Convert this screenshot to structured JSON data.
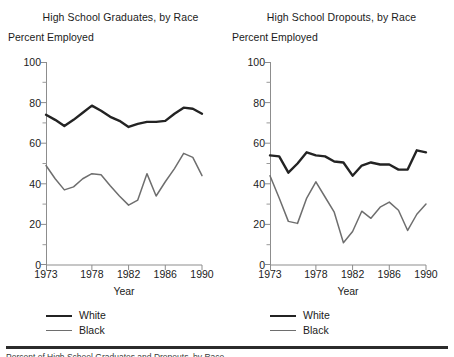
{
  "figure": {
    "axis_color": "#8d8d8d",
    "white_series_color": "#232323",
    "black_series_color": "#6e6e6e",
    "rule_color": "#2b2b2b",
    "footnote": "Percent of High School Graduates and Dropouts, by Race"
  },
  "panels": [
    {
      "title": "High School Graduates, by Race",
      "ylabel": "Percent Employed",
      "xlabel": "Year",
      "legend": [
        {
          "label": "White"
        },
        {
          "label": "Black"
        }
      ]
    },
    {
      "title": "High School Dropouts, by Race",
      "ylabel": "Percent Employed",
      "xlabel": "Year",
      "legend": [
        {
          "label": "White"
        },
        {
          "label": "Black"
        }
      ]
    }
  ],
  "chart_data": [
    {
      "type": "line",
      "title": "High School Graduates, by Race",
      "xlabel": "Year",
      "ylabel": "Percent Employed",
      "xlim": [
        1973,
        1990
      ],
      "ylim": [
        0,
        100
      ],
      "ytick_labels": [
        "0",
        "20",
        "40",
        "60",
        "80",
        "100"
      ],
      "ytick_values": [
        0,
        20,
        40,
        60,
        80,
        100
      ],
      "yminor_values": [
        10,
        30,
        50,
        70,
        90
      ],
      "xtick_labels": [
        "1973",
        "1978",
        "1982",
        "1986",
        "1990"
      ],
      "xtick_values": [
        1973,
        1978,
        1982,
        1986,
        1990
      ],
      "grid": false,
      "legend_position": "below-left",
      "x": [
        1973,
        1974,
        1975,
        1976,
        1977,
        1978,
        1979,
        1980,
        1981,
        1982,
        1983,
        1984,
        1985,
        1986,
        1987,
        1988,
        1989,
        1990
      ],
      "series": [
        {
          "name": "White",
          "color": "#232323",
          "values": [
            74.0,
            71.5,
            68.5,
            71.5,
            75.0,
            78.5,
            76.0,
            73.0,
            71.0,
            68.0,
            69.5,
            70.5,
            70.5,
            71.0,
            74.5,
            77.5,
            77.0,
            74.5
          ]
        },
        {
          "name": "Black",
          "color": "#6e6e6e",
          "values": [
            49.0,
            42.5,
            37.0,
            38.5,
            42.5,
            45.0,
            44.5,
            39.0,
            34.0,
            29.5,
            32.0,
            45.0,
            34.0,
            41.0,
            47.5,
            55.0,
            53.0,
            44.0
          ]
        }
      ]
    },
    {
      "type": "line",
      "title": "High School Dropouts, by Race",
      "xlabel": "Year",
      "ylabel": "Percent Employed",
      "xlim": [
        1973,
        1990
      ],
      "ylim": [
        0,
        100
      ],
      "ytick_labels": [
        "0",
        "20",
        "40",
        "60",
        "80",
        "100"
      ],
      "ytick_values": [
        0,
        20,
        40,
        60,
        80,
        100
      ],
      "yminor_values": [
        10,
        30,
        50,
        70,
        90
      ],
      "xtick_labels": [
        "1973",
        "1978",
        "1982",
        "1986",
        "1990"
      ],
      "xtick_values": [
        1973,
        1978,
        1982,
        1986,
        1990
      ],
      "grid": false,
      "legend_position": "below-left",
      "x": [
        1973,
        1974,
        1975,
        1976,
        1977,
        1978,
        1979,
        1980,
        1981,
        1982,
        1983,
        1984,
        1985,
        1986,
        1987,
        1988,
        1989,
        1990
      ],
      "series": [
        {
          "name": "White",
          "color": "#232323",
          "values": [
            54.0,
            53.5,
            45.5,
            50.0,
            55.5,
            54.0,
            53.5,
            51.0,
            50.5,
            44.0,
            49.0,
            50.5,
            49.5,
            49.5,
            47.0,
            47.0,
            56.5,
            55.5
          ]
        },
        {
          "name": "Black",
          "color": "#6e6e6e",
          "values": [
            44.0,
            33.0,
            21.5,
            20.5,
            33.0,
            41.0,
            33.5,
            26.0,
            11.0,
            16.5,
            26.5,
            23.0,
            28.5,
            31.0,
            27.0,
            17.0,
            25.0,
            30.0
          ]
        }
      ]
    }
  ]
}
